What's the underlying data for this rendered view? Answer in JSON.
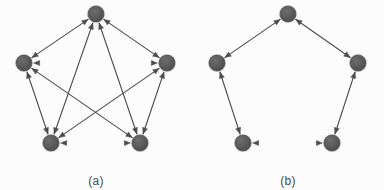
{
  "figure": {
    "type": "graph-diagram",
    "background_color": "#fefefe",
    "node_color": "#5a5a5a",
    "node_edge_color": "#4a4a4a",
    "arrow_color": "#4d4d4d",
    "caption_color": "#4a4a4a",
    "node_radius": 8,
    "arrow_stroke_width": 1.1
  },
  "panels": [
    {
      "id": "panel-a",
      "caption": "(a)",
      "caption_x": 96,
      "caption_y": 174,
      "graph_type": "complete-graph",
      "node_count": 5,
      "edge_count": 10,
      "edges_bidirectional": true,
      "description": "complete graph K5 with all pairs connected by double-headed arrows",
      "nodes": [
        {
          "id": "a-top",
          "label": "",
          "x": 96,
          "y": 14
        },
        {
          "id": "a-right",
          "label": "",
          "x": 167,
          "y": 63
        },
        {
          "id": "a-bottom-right",
          "label": "",
          "x": 140,
          "y": 143
        },
        {
          "id": "a-bottom-left",
          "label": "",
          "x": 51,
          "y": 143
        },
        {
          "id": "a-left",
          "label": "",
          "x": 24,
          "y": 63
        }
      ],
      "edges": [
        {
          "from": "a-top",
          "to": "a-right",
          "kind": "side"
        },
        {
          "from": "a-right",
          "to": "a-bottom-right",
          "kind": "side"
        },
        {
          "from": "a-bottom-right",
          "to": "a-bottom-left",
          "kind": "side"
        },
        {
          "from": "a-bottom-left",
          "to": "a-left",
          "kind": "side"
        },
        {
          "from": "a-left",
          "to": "a-top",
          "kind": "side"
        },
        {
          "from": "a-top",
          "to": "a-bottom-right",
          "kind": "diagonal"
        },
        {
          "from": "a-top",
          "to": "a-bottom-left",
          "kind": "diagonal"
        },
        {
          "from": "a-right",
          "to": "a-bottom-left",
          "kind": "diagonal"
        },
        {
          "from": "a-right",
          "to": "a-left",
          "kind": "diagonal"
        },
        {
          "from": "a-bottom-right",
          "to": "a-left",
          "kind": "diagonal"
        }
      ]
    },
    {
      "id": "panel-b",
      "caption": "(b)",
      "caption_x": 288,
      "caption_y": 174,
      "graph_type": "cycle-graph",
      "node_count": 5,
      "edge_count": 5,
      "edges_bidirectional": true,
      "description": "pentagon ring graph C5 with outer edges only, double-headed arrows",
      "nodes": [
        {
          "id": "b-top",
          "label": "",
          "x": 288,
          "y": 14
        },
        {
          "id": "b-right",
          "label": "",
          "x": 358,
          "y": 63
        },
        {
          "id": "b-bottom-right",
          "label": "",
          "x": 332,
          "y": 143
        },
        {
          "id": "b-bottom-left",
          "label": "",
          "x": 243,
          "y": 143
        },
        {
          "id": "b-left",
          "label": "",
          "x": 217,
          "y": 63
        }
      ],
      "edges": [
        {
          "from": "b-top",
          "to": "b-right",
          "kind": "side"
        },
        {
          "from": "b-right",
          "to": "b-bottom-right",
          "kind": "side"
        },
        {
          "from": "b-bottom-right",
          "to": "b-bottom-left",
          "kind": "side"
        },
        {
          "from": "b-bottom-left",
          "to": "b-left",
          "kind": "side"
        },
        {
          "from": "b-left",
          "to": "b-top",
          "kind": "side"
        }
      ]
    }
  ]
}
